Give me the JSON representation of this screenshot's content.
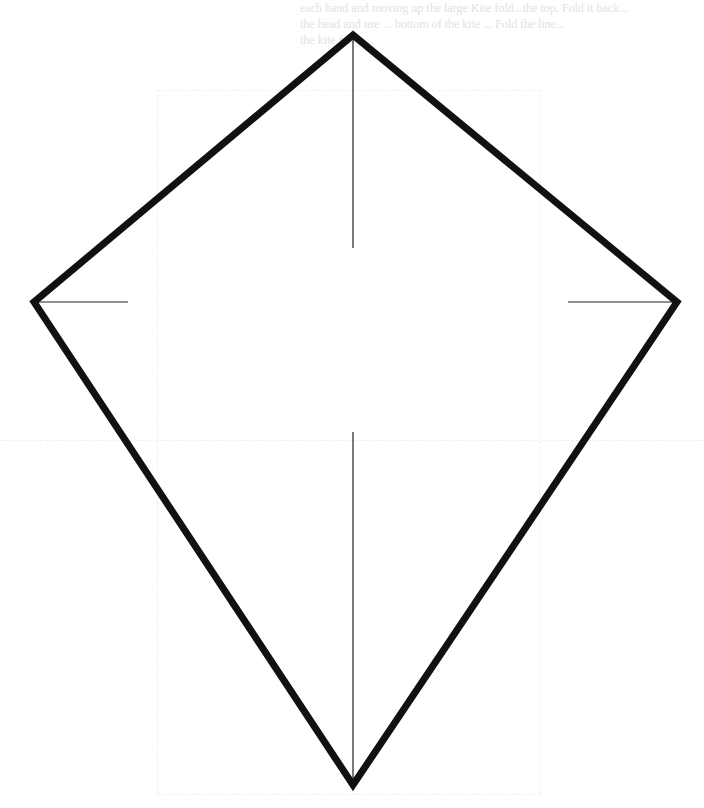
{
  "page": {
    "type": "kite template diagram (scanned page)",
    "background_color": "#ffffff"
  },
  "header_text": {
    "note": "faint show-through text from reverse side, mostly illegible",
    "lines": [
      "each hand and moving up the large Kite fold...the top. Fold it back...",
      "the head and use ... bottom of the kite ... Fold the line...",
      "the kite fully ..."
    ],
    "color": "#e2e2e2"
  },
  "kite": {
    "outline_color": "#111111",
    "outline_width": 7,
    "vertices": {
      "top": [
        353,
        35
      ],
      "right": [
        677,
        302
      ],
      "bottom": [
        353,
        785
      ],
      "left": [
        34,
        302
      ]
    },
    "guide_lines": {
      "color": "#222222",
      "width": 1.2,
      "vertical_top": {
        "x": 353,
        "y1": 35,
        "y2": 248
      },
      "vertical_bottom": {
        "x": 353,
        "y1": 432,
        "y2": 785
      },
      "horizontal_left": {
        "y": 302,
        "x1": 34,
        "x2": 128
      },
      "horizontal_right": {
        "y": 302,
        "x1": 568,
        "x2": 677
      }
    }
  }
}
